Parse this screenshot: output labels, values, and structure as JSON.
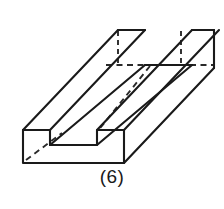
{
  "figure": {
    "caption": "(6)",
    "shape_name": "u-channel-block",
    "projection": "isometric",
    "colors": {
      "stroke": "#1a1a1a",
      "hidden_stroke": "#2a2a2a",
      "face": "#ffffff",
      "background": "#ffffff"
    },
    "geometry": {
      "depth_offset_x": 95,
      "depth_offset_y": -65,
      "front_left_x": 23,
      "front_bottom_y": 163,
      "front_top_y": 130,
      "front_right_x": 124,
      "groove_left_x": 50,
      "groove_right_x": 97,
      "groove_floor_y": 145,
      "back_top_y": 30,
      "back_right_x": 214,
      "hidden_line_y": 65
    },
    "vertices": {
      "front_bottom_left": [
        23,
        163
      ],
      "front_bottom_right": [
        124,
        163
      ],
      "front_top_left": [
        23,
        130
      ],
      "front_top_right": [
        124,
        130
      ],
      "groove_floor_left": [
        50,
        145
      ],
      "groove_floor_right": [
        97,
        145
      ],
      "groove_top_left": [
        50,
        130
      ],
      "groove_top_right": [
        97,
        130
      ],
      "back_bottom_left": [
        118,
        98
      ],
      "back_bottom_right": [
        219,
        98
      ],
      "back_top_left": [
        118,
        30
      ],
      "back_top_right": [
        214,
        30
      ],
      "back_groove_left": [
        145,
        65
      ],
      "back_groove_right": [
        192,
        65
      ]
    }
  }
}
